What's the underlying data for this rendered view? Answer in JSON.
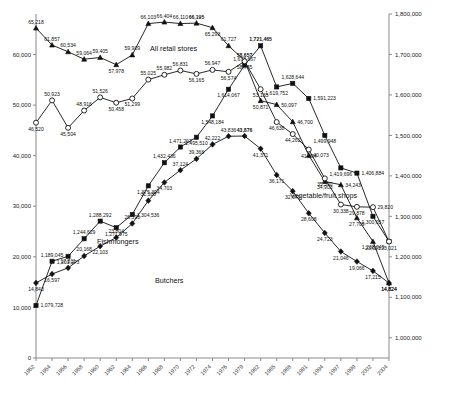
{
  "chart_data": {
    "type": "line",
    "title": "",
    "xlabel": "",
    "ylabel": "",
    "grid": false,
    "legend_position": "inline-series-labels",
    "categories": [
      "1952",
      "1954",
      "1956",
      "1958",
      "1960",
      "1962",
      "1964",
      "1966",
      "1968",
      "1970",
      "1972",
      "1974",
      "1976",
      "1979",
      "1982",
      "1985",
      "1988",
      "1991",
      "1994",
      "1997",
      "1999",
      "2002",
      "2004"
    ],
    "left_axis": {
      "ticks": [
        "0",
        "10,000",
        "20,000",
        "30,000",
        "40,000",
        "50,000",
        "60,000"
      ],
      "ylim": [
        0,
        68000
      ]
    },
    "right_axis": {
      "ticks": [
        "1,000,000",
        "1,100,000",
        "1,200,000",
        "1,300,000",
        "1,400,000",
        "1,500,000",
        "1,600,000",
        "1,700,000",
        "1,800,000"
      ],
      "ylim": [
        950000,
        1800000
      ]
    },
    "series": [
      {
        "name": "All retail stores",
        "axis": "right",
        "marker": "square",
        "values": [
          1079728,
          1189045,
          1201273,
          1244629,
          1288292,
          1271975,
          1304536,
          1375394,
          1432436,
          1471297,
          1495510,
          1548184,
          1614067,
          1673667,
          1721465,
          1619752,
          1628644,
          1591223,
          1499948,
          1419696,
          1406884,
          1300057,
          1238049
        ],
        "labels": [
          "1,079,728",
          "1,189,045",
          "1,201,273",
          "1,244,629",
          "1,288,292",
          "1,271,975",
          "1,304,536",
          "1,375,394",
          "1,432,436",
          "1,471,297",
          "1,495,510",
          "1,548,184",
          "1,614,067",
          "1,673,667",
          "1,721,465",
          "1,619,752",
          "1,628,644",
          "1,591,223",
          "1,499,948",
          "1,419,696",
          "1,406,884",
          "1,300,057",
          "1,238,049"
        ],
        "bold_labels": [
          "1,721,465"
        ]
      },
      {
        "name": "Vegetable/fruit shops",
        "axis": "left",
        "marker": "triangle",
        "values": [
          65218,
          61857,
          60534,
          59064,
          59405,
          57978,
          59909,
          66103,
          66404,
          66110,
          66195,
          65293,
          61727,
          58785,
          50871,
          50097,
          46700,
          40073,
          34903,
          34243,
          27709,
          23021,
          14824
        ],
        "labels": [
          "65,218",
          "61,857",
          "60,534",
          "59,064",
          "59,405",
          "57,978",
          "59,909",
          "66,103",
          "66,404",
          "66,110",
          "66,195",
          "65,293",
          "61,727",
          "58,785",
          "50,871",
          "50,097",
          "46,700",
          "40,073",
          "34,903",
          "34,243",
          "27,709",
          "23,021",
          "14,824"
        ],
        "bold_labels": [
          "66,195"
        ]
      },
      {
        "name": "Fishmongers",
        "axis": "left",
        "marker": "circle",
        "values": [
          46520,
          50923,
          45504,
          48916,
          51526,
          50458,
          51299,
          55025,
          55982,
          56831,
          56165,
          56947,
          56574,
          58657,
          53133,
          46638,
          44262,
          41204,
          35500,
          30338,
          29878,
          29820,
          23021
        ],
        "labels": [
          "46,520",
          "50,923",
          "45,504",
          "48,916",
          "51,526",
          "50,458",
          "51,299",
          "55,025",
          "55,982",
          "56,831",
          "56,165",
          "56,947",
          "56,574",
          "58,657",
          "53,133",
          "46,638",
          "44,262",
          "41,204",
          "35,500",
          "30,338",
          "29,878",
          "29,820",
          "23,021"
        ],
        "bold_labels": [
          "58,657"
        ]
      },
      {
        "name": "Butchers",
        "axis": "left",
        "marker": "diamond",
        "values": [
          14843,
          16597,
          17811,
          20168,
          22103,
          23804,
          26590,
          31100,
          34703,
          37124,
          39366,
          42222,
          43836,
          43876,
          41371,
          36171,
          32979,
          28608,
          24723,
          21046,
          19066,
          17215,
          14824
        ],
        "labels": [
          "14,843",
          "16,597",
          "17,811",
          "20,168",
          "22,103",
          "23,804",
          "26,590",
          "31,100",
          "34,703",
          "37,124",
          "39,366",
          "42,222",
          "43,836",
          "43,876",
          "41,371",
          "36,171",
          "32,979",
          "28,608",
          "24,723",
          "21,046",
          "19,066",
          "17,215",
          "14,824"
        ],
        "bold_labels": [
          "43,876"
        ]
      }
    ],
    "annotations": [
      {
        "text": "All retail stores",
        "name": "series-label-all-retail-stores"
      },
      {
        "text": "Vegetable/fruit shops",
        "name": "series-label-vegetable-fruit-shops"
      },
      {
        "text": "Fishmongers",
        "name": "series-label-fishmongers"
      },
      {
        "text": "Butchers",
        "name": "series-label-butchers"
      }
    ]
  }
}
